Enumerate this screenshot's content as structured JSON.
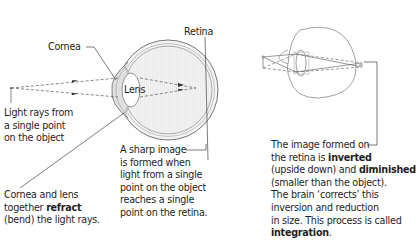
{
  "labels": {
    "cornea": "Cornea",
    "retina": "Retina",
    "lens": "Lens"
  },
  "captions": {
    "light_rays": [
      "Light rays from",
      "a single point",
      "on the object"
    ],
    "sharp_image": [
      "A sharp image",
      "is formed when",
      "light from a single",
      "point on the object",
      "reaches a single",
      "point on the retina."
    ],
    "refract": {
      "line1": "Cornea and lens",
      "line2_pre": "together ",
      "line2_bold": "refract",
      "line3": "(bend) the light rays."
    },
    "image_formed": {
      "line1": "The image formed on",
      "line2_pre": "the retina is ",
      "line2_bold": "inverted",
      "line3_pre": "(upside down) and ",
      "line3_bold": "diminished",
      "line4": "(smaller than the object).",
      "line5": "The brain ‘corrects’ this",
      "line6": "inversion and reduction",
      "line7": "in size. This process is called",
      "line8_bold": "integration",
      "line8_post": "."
    }
  },
  "colors": {
    "line": "#555555",
    "eye_fill": "#ececec",
    "eye_stroke": "#777777",
    "text": "#1e1e1e"
  }
}
